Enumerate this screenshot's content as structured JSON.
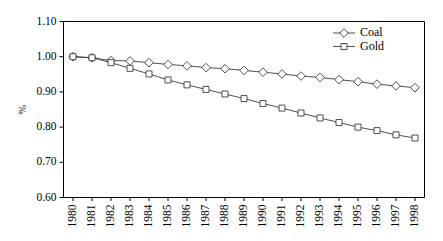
{
  "chart_data": {
    "type": "line",
    "title": "",
    "xlabel": "",
    "ylabel": "%",
    "ylim": [
      0.6,
      1.1
    ],
    "ytick_labels": [
      "0.60",
      "0.70",
      "0.80",
      "0.90",
      "1.00",
      "1.10"
    ],
    "ytick_values": [
      0.6,
      0.7,
      0.8,
      0.9,
      1.0,
      1.1
    ],
    "grid": false,
    "legend_position": "top-right",
    "categories": [
      "1980",
      "1981",
      "1982",
      "1983",
      "1984",
      "1985",
      "1986",
      "1987",
      "1988",
      "1989",
      "1990",
      "1991",
      "1992",
      "1993",
      "1994",
      "1995",
      "1996",
      "1997",
      "1998"
    ],
    "x": [
      1980,
      1981,
      1982,
      1983,
      1984,
      1985,
      1986,
      1987,
      1988,
      1989,
      1990,
      1991,
      1992,
      1993,
      1994,
      1995,
      1996,
      1997,
      1998
    ],
    "series": [
      {
        "name": "Coal",
        "marker": "diamond",
        "values": [
          1.0,
          0.997,
          0.989,
          0.988,
          0.983,
          0.978,
          0.974,
          0.969,
          0.966,
          0.961,
          0.956,
          0.951,
          0.945,
          0.941,
          0.935,
          0.929,
          0.922,
          0.917,
          0.912
        ]
      },
      {
        "name": "Gold",
        "marker": "square",
        "values": [
          1.0,
          0.997,
          0.983,
          0.967,
          0.951,
          0.934,
          0.92,
          0.907,
          0.894,
          0.881,
          0.867,
          0.854,
          0.84,
          0.826,
          0.813,
          0.8,
          0.79,
          0.778,
          0.769
        ]
      }
    ]
  },
  "legend": {
    "items": [
      {
        "label": "Coal"
      },
      {
        "label": "Gold"
      }
    ]
  }
}
